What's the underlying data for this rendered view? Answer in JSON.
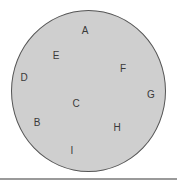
{
  "diagram": {
    "type": "labeled-points-in-circle",
    "colors": {
      "circle_fill": "#cfcfcf",
      "circle_stroke": "#555555",
      "label_text": "#3a3a3a",
      "bottom_rule": "#9a9a9a",
      "background": "#ffffff"
    },
    "points": [
      {
        "label": "A",
        "x": 85,
        "y": 31
      },
      {
        "label": "E",
        "x": 56,
        "y": 56
      },
      {
        "label": "F",
        "x": 123,
        "y": 69
      },
      {
        "label": "D",
        "x": 24,
        "y": 78
      },
      {
        "label": "G",
        "x": 151,
        "y": 95
      },
      {
        "label": "C",
        "x": 76,
        "y": 104
      },
      {
        "label": "B",
        "x": 37,
        "y": 123
      },
      {
        "label": "H",
        "x": 117,
        "y": 128
      },
      {
        "label": "I",
        "x": 72,
        "y": 151
      }
    ]
  }
}
